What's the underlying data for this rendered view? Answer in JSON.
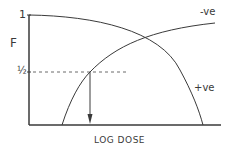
{
  "diagram": {
    "y_axis_label": "F",
    "y_tick_top": "1",
    "y_tick_half": "½",
    "x_axis_label": "LOG DOSE",
    "curves": [
      {
        "name": "negative-curve",
        "label": "-ve",
        "shape": "rising"
      },
      {
        "name": "positive-curve",
        "label": "+ve",
        "shape": "falling"
      }
    ],
    "annotations": {
      "half_line": "dashed horizontal line at F = 1/2",
      "arrow": "down arrow from intersection of -ve curve with F = 1/2 to log dose axis"
    },
    "colors": {
      "line": "#3a3a3a",
      "background": "#ffffff"
    }
  }
}
